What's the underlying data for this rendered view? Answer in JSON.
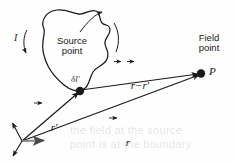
{
  "figure": {
    "background_color": "#fefefe",
    "ink_color": "#1a1a1a",
    "axis_gray": "#808080"
  },
  "labels": {
    "source_point": "Source\npoint",
    "field_point": "Field\npoint",
    "field_point_symbol": "P",
    "current": "I",
    "line_element": "δl′",
    "separation_vector": "r−r′",
    "separation_vector_parts": {
      "first": "r",
      "minus": "−",
      "second": "r",
      "prime": "′"
    },
    "source_position_vector": "r",
    "source_position_vector_prime": "′",
    "field_position_vector": "r"
  },
  "ghost_text": {
    "line1": "the field at the source",
    "line2": "point is at the boundary"
  },
  "chart_data": {
    "type": "diagram",
    "elements": [
      {
        "name": "current-loop",
        "kind": "closed-curve",
        "label": "Source point"
      },
      {
        "name": "source-point-dot",
        "kind": "point",
        "x": 80,
        "y": 91,
        "label": "δl′"
      },
      {
        "name": "field-point-dot",
        "kind": "point",
        "x": 201,
        "y": 74,
        "label": "P"
      },
      {
        "name": "origin",
        "kind": "point",
        "x": 22,
        "y": 141
      },
      {
        "name": "vector-r-prime",
        "kind": "arrow",
        "from": [
          22,
          141
        ],
        "to": [
          80,
          91
        ],
        "label": "r′"
      },
      {
        "name": "vector-r",
        "kind": "arrow",
        "from": [
          22,
          141
        ],
        "to": [
          201,
          74
        ],
        "label": "r"
      },
      {
        "name": "vector-r-minus-r-prime",
        "kind": "arrow",
        "from": [
          80,
          91
        ],
        "to": [
          201,
          74
        ],
        "label": "r−r′"
      },
      {
        "name": "current-arrow-left",
        "kind": "curved-arrow",
        "label": "I"
      },
      {
        "name": "current-arrow-top",
        "kind": "curved-arrow"
      },
      {
        "name": "current-arrow-right",
        "kind": "curved-arrow"
      },
      {
        "name": "axis-x",
        "kind": "arrow",
        "from": [
          22,
          141
        ],
        "to": [
          48,
          140
        ]
      },
      {
        "name": "axis-y",
        "kind": "arrow",
        "from": [
          22,
          141
        ],
        "to": [
          11,
          122
        ]
      },
      {
        "name": "axis-z",
        "kind": "arrow",
        "from": [
          22,
          141
        ],
        "to": [
          12,
          157
        ]
      }
    ]
  }
}
